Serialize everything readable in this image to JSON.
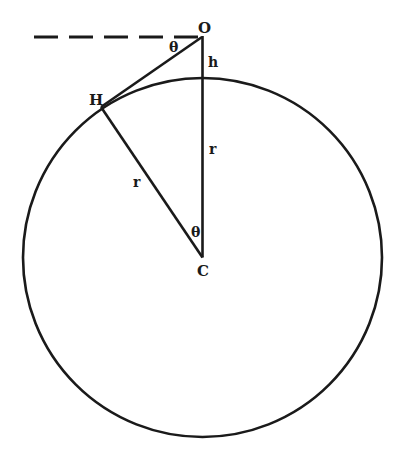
{
  "diagram": {
    "colors": {
      "stroke": "#1a1a1a",
      "background": "#ffffff"
    },
    "circle": {
      "cx": 202.5,
      "cy": 257.5,
      "r": 179.5
    },
    "points": {
      "O": {
        "x": 202,
        "y": 37,
        "label": "O"
      },
      "H": {
        "x": 101,
        "y": 107,
        "label": "H"
      },
      "C": {
        "x": 202.5,
        "y": 257.5,
        "label": "C"
      }
    },
    "dashed_line": {
      "x1": 34,
      "y1": 37,
      "x2": 202,
      "y2": 37
    },
    "labels": {
      "O": "O",
      "H": "H",
      "C": "C",
      "h": "h",
      "r_vertical": "r",
      "r_slant": "r",
      "theta_top": "θ",
      "theta_center": "θ"
    }
  }
}
